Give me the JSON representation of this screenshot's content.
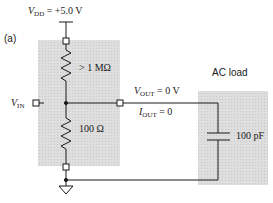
{
  "figure_label": "(a)",
  "supply": {
    "symbol": "V",
    "subscript": "DD",
    "value": " = +5.0 V"
  },
  "input": {
    "symbol": "V",
    "subscript": "IN"
  },
  "upper_resistor": {
    "value": "> 1 MΩ"
  },
  "lower_resistor": {
    "value": "100 Ω"
  },
  "output_voltage": {
    "symbol": "V",
    "subscript": "OUT",
    "value": " = 0 V"
  },
  "output_current": {
    "symbol": "I",
    "subscript": "OUT",
    "value": " = 0"
  },
  "load": {
    "title": "AC load",
    "capacitor_value": "100 pF"
  },
  "colors": {
    "wire": "#1a1a1a",
    "shaded_box": "#d9d9d9"
  }
}
